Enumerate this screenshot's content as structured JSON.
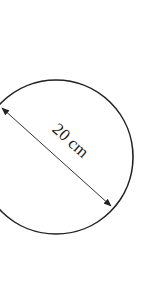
{
  "diagram": {
    "shape": "circle",
    "measurement": "diameter",
    "label": "20 cm",
    "colors": {
      "stroke": "#222222",
      "background": "#ffffff"
    }
  }
}
